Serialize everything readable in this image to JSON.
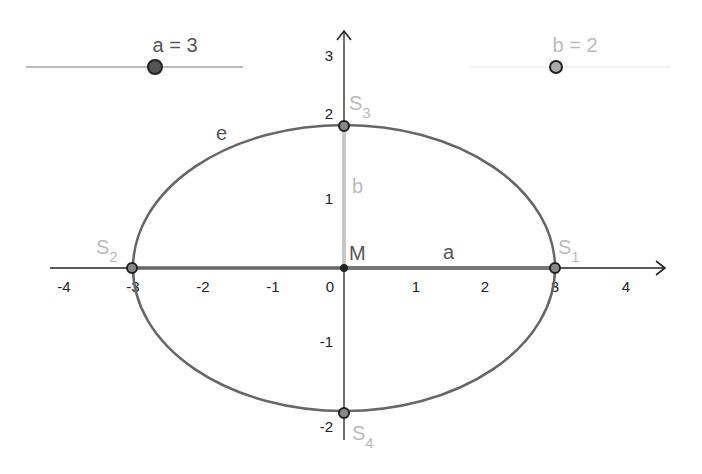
{
  "sliders": [
    {
      "name": "a",
      "label": "a = 3",
      "value": 3,
      "color": "#555555"
    },
    {
      "name": "b",
      "label": "b = 2",
      "value": 2,
      "color": "#aaaaaa"
    }
  ],
  "axes": {
    "x_ticks": [
      "-4",
      "-3",
      "-2",
      "-1",
      "0",
      "1",
      "2",
      "3",
      "4"
    ],
    "y_ticks": [
      "3",
      "2",
      "1",
      "-1",
      "-2"
    ]
  },
  "ellipse": {
    "label": "e",
    "center": [
      0,
      0
    ],
    "a": 3,
    "b": 2,
    "color": "#666666"
  },
  "points": {
    "M": {
      "label": "M",
      "coords": [
        0,
        0
      ]
    },
    "S1": {
      "label": "S",
      "sub": "1",
      "coords": [
        3,
        0
      ]
    },
    "S2": {
      "label": "S",
      "sub": "2",
      "coords": [
        -3,
        0
      ]
    },
    "S3": {
      "label": "S",
      "sub": "3",
      "coords": [
        0,
        2
      ]
    },
    "S4": {
      "label": "S",
      "sub": "4",
      "coords": [
        0,
        -2
      ]
    }
  },
  "segments": {
    "a": {
      "label": "a",
      "color": "#666666"
    },
    "b": {
      "label": "b",
      "color": "#bbbbbb"
    }
  },
  "colors": {
    "axis": "#222222",
    "label_light": "#bbbbbb",
    "label_dark": "#555555"
  }
}
